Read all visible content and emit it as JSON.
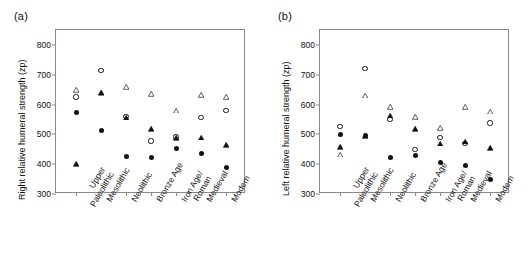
{
  "figure": {
    "panels": [
      {
        "label": "(a)",
        "ylabel": "Right relative humeral strength (zp)",
        "name": "panel-a"
      },
      {
        "label": "(b)",
        "ylabel": "Left relative humeral strength (zp)",
        "name": "panel-b"
      }
    ]
  },
  "chart_data": [
    {
      "type": "scatter",
      "title": "(a)",
      "xlabel": "",
      "ylabel": "Right relative humeral strength (zp)",
      "ylim": [
        300,
        850
      ],
      "yticks": [
        300,
        400,
        500,
        600,
        700,
        800
      ],
      "grid": false,
      "legend": "none",
      "categories": [
        "Upper Paleolithic",
        "Mesolithic",
        "Neolithic",
        "Bronze Age",
        "Iron Age/ Roman",
        "Medieval",
        "Modern"
      ],
      "series": [
        {
          "name": "open-triangle",
          "marker": "triangle-open",
          "values": [
            648,
            638,
            658,
            635,
            580,
            632,
            625
          ]
        },
        {
          "name": "open-circle",
          "marker": "circle-open",
          "values": [
            625,
            715,
            560,
            478,
            491,
            557,
            581
          ]
        },
        {
          "name": "filled-triangle",
          "marker": "triangle-filled",
          "values": [
            400,
            640,
            557,
            518,
            487,
            489,
            465
          ]
        },
        {
          "name": "filled-circle",
          "marker": "circle-filled",
          "values": [
            572,
            513,
            425,
            424,
            453,
            436,
            390
          ]
        }
      ]
    },
    {
      "type": "scatter",
      "title": "(b)",
      "xlabel": "",
      "ylabel": "Left relative humeral strength (zp)",
      "ylim": [
        300,
        850
      ],
      "yticks": [
        300,
        400,
        500,
        600,
        700,
        800
      ],
      "grid": false,
      "legend": "none",
      "categories": [
        "Upper Paleolithic",
        "Mesolithic",
        "Neolithic",
        "Bronze Age",
        "Iron Age/ Roman",
        "Medieval",
        "Modern"
      ],
      "series": [
        {
          "name": "open-triangle",
          "marker": "triangle-open",
          "values": [
            432,
            631,
            591,
            558,
            521,
            591,
            577
          ]
        },
        {
          "name": "open-circle",
          "marker": "circle-open",
          "values": [
            527,
            722,
            549,
            450,
            490,
            470,
            538
          ]
        },
        {
          "name": "filled-triangle",
          "marker": "triangle-filled",
          "values": [
            458,
            494,
            563,
            518,
            470,
            476,
            455
          ]
        },
        {
          "name": "filled-circle",
          "marker": "circle-filled",
          "values": [
            498,
            496,
            423,
            428,
            404,
            395,
            350
          ]
        }
      ]
    }
  ],
  "axis": {
    "ytick_labels": [
      "800",
      "700",
      "600",
      "500",
      "400",
      "300"
    ],
    "category_lines": [
      [
        "Upper",
        "Paleolithic"
      ],
      [
        "Mesolithic"
      ],
      [
        "Neolithic"
      ],
      [
        "Bronze Age"
      ],
      [
        "Iron Age/",
        "Roman"
      ],
      [
        "Medieval"
      ],
      [
        "Modern"
      ]
    ]
  }
}
